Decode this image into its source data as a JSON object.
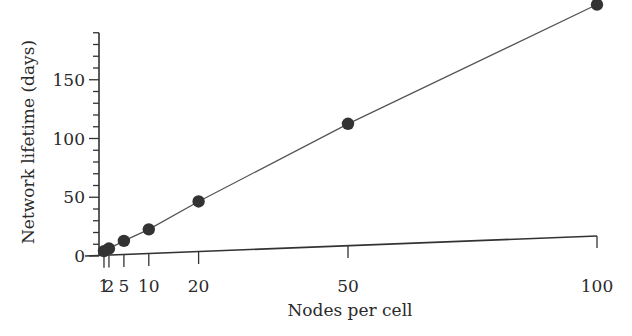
{
  "chart_data": {
    "type": "line",
    "title": "",
    "xlabel": "Nodes per cell",
    "ylabel": "Network lifetime (days)",
    "x": [
      1,
      2,
      5,
      10,
      20,
      50,
      100
    ],
    "series": [
      {
        "name": "Network lifetime",
        "values": [
          4,
          6,
          12,
          21,
          43,
          104,
          197
        ],
        "marker": "filled-circle",
        "color": "#333333"
      }
    ],
    "xticks": [
      1,
      2,
      5,
      10,
      20,
      50,
      100
    ],
    "xtick_labels": [
      "1",
      "2",
      "5",
      "10",
      "20",
      "50",
      "100"
    ],
    "yticks_major": [
      0,
      50,
      100,
      150
    ],
    "ytick_labels": [
      "0",
      "50",
      "100",
      "150"
    ],
    "yticks_minor_step": 10,
    "xlim": [
      0,
      100
    ],
    "ylim": [
      0,
      190
    ],
    "grid": false,
    "legend": null
  }
}
